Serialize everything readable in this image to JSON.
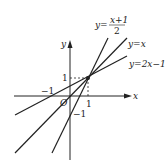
{
  "diagram": {
    "type": "coordinate-plane-lines",
    "axes": {
      "x_label": "x",
      "y_label": "y",
      "origin_label": "O",
      "tick_x_pos": "1",
      "tick_x_neg": "−1",
      "tick_y_pos": "1",
      "tick_y_neg": "−1"
    },
    "lines": [
      {
        "name": "line-x-plus-1-over-2",
        "label_prefix": "y=",
        "numerator": "x+1",
        "denominator": "2",
        "slope": 0.5,
        "intercept": 0.5
      },
      {
        "name": "line-y-equals-x",
        "label": "y=x",
        "slope": 1,
        "intercept": 0
      },
      {
        "name": "line-2x-minus-1",
        "label": "y=2x−1",
        "slope": 2,
        "intercept": -1
      }
    ],
    "intersection_point": {
      "x": 1,
      "y": 1
    },
    "colors": {
      "stroke": "#222222",
      "background": "#ffffff"
    }
  }
}
